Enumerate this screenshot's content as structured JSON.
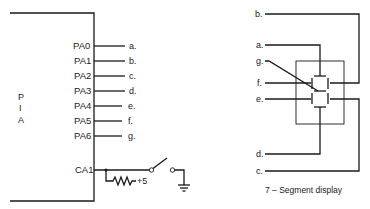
{
  "pia": {
    "label_letters": [
      "P",
      "I",
      "A"
    ],
    "pins": [
      {
        "name": "PA0",
        "signal": "a."
      },
      {
        "name": "PA1",
        "signal": "b."
      },
      {
        "name": "PA2",
        "signal": "c."
      },
      {
        "name": "PA3",
        "signal": "d."
      },
      {
        "name": "PA4",
        "signal": "e."
      },
      {
        "name": "PA5",
        "signal": "f."
      },
      {
        "name": "PA6",
        "signal": "g."
      }
    ],
    "control_pin": "CA1",
    "supply_label": "+5"
  },
  "display": {
    "inputs": {
      "b": "b.",
      "a": "a.",
      "g": "g.",
      "f": "f.",
      "e": "e.",
      "d": "d.",
      "c": "c."
    },
    "caption": "7 – Segment display"
  }
}
